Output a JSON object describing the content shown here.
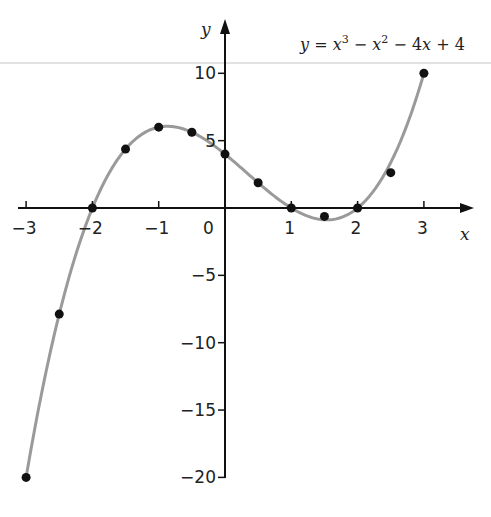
{
  "chart_data": {
    "type": "line",
    "title_parts": {
      "y": "y",
      "eq": "=",
      "x1": "x",
      "e1": "3",
      "minus1": "−",
      "x2": "x",
      "e2": "2",
      "minus2": "− 4",
      "x3": "x",
      "plus": "+ 4"
    },
    "xlabel": "x",
    "ylabel": "y",
    "xlim": [
      -3,
      3
    ],
    "ylim": [
      -20,
      10
    ],
    "grid": false,
    "x_ticks": [
      -3,
      -2,
      -1,
      0,
      1,
      2,
      3
    ],
    "x_tick_labels": [
      "−3",
      "−2",
      "−1",
      "0",
      "1",
      "2",
      "3"
    ],
    "y_ticks": [
      10,
      5,
      -5,
      -10,
      -15,
      -20
    ],
    "y_tick_labels": [
      "10",
      "5",
      "−5",
      "−10",
      "−15",
      "−20"
    ],
    "series": [
      {
        "name": "y = x^3 − x^2 − 4x + 4",
        "x": [
          -3,
          -2.5,
          -2,
          -1.5,
          -1,
          -0.5,
          0,
          0.5,
          1,
          1.5,
          2,
          2.5,
          3
        ],
        "values": [
          -20,
          -7.875,
          0,
          4.375,
          6,
          5.625,
          4,
          1.875,
          0,
          -0.625,
          0,
          2.625,
          10
        ]
      }
    ],
    "colors": {
      "curve": "#9a9a9a",
      "points": "#111111",
      "axes": "#111111"
    }
  }
}
